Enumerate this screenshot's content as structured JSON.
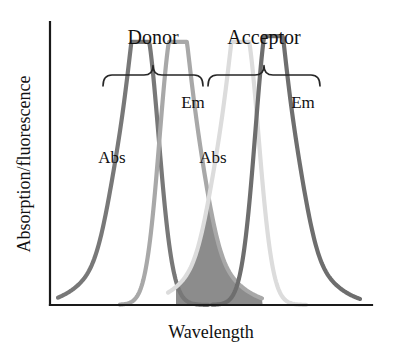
{
  "figure": {
    "kind": "fret-spectral-overlap-diagram",
    "background": "#ffffff"
  },
  "axes": {
    "y_label": "Absorption/fluorescence",
    "x_label": "Wavelength",
    "axis_color": "#1a1a1a",
    "origin_px": {
      "x": 50,
      "y": 305
    },
    "y_top_px": 22,
    "x_right_px": 372,
    "ticks": [],
    "gridlines": false
  },
  "groups": [
    {
      "id": "donor",
      "label": "Donor",
      "brace_x0": 103,
      "brace_x1": 203,
      "label_x": 153,
      "label_y": 44
    },
    {
      "id": "acceptor",
      "label": "Acceptor",
      "brace_x0": 208,
      "brace_x1": 320,
      "label_x": 264,
      "label_y": 44
    }
  ],
  "peak_labels": [
    {
      "id": "donor-em-label",
      "text": "Em",
      "x": 193,
      "y": 108
    },
    {
      "id": "donor-abs-label",
      "text": "Abs",
      "x": 112,
      "y": 163
    },
    {
      "id": "acceptor-em-label",
      "text": "Em",
      "x": 303,
      "y": 108
    },
    {
      "id": "acceptor-abs-label",
      "text": "Abs",
      "x": 213,
      "y": 163
    }
  ],
  "colors": {
    "donor_abs": "#787878",
    "donor_em": "#a8a8a8",
    "acceptor_abs": "#dcdcdc",
    "acceptor_em": "#6e6e6e",
    "overlap_fill": "#8c8c8c",
    "axis": "#1a1a1a",
    "text": "#111111"
  },
  "chart_data": {
    "type": "line",
    "title": "",
    "xlabel": "Wavelength",
    "ylabel": "Absorption/fluorescence",
    "xlim": [
      50,
      372
    ],
    "ylim": [
      0,
      1
    ],
    "grid": false,
    "legend_position": "inline-annotations",
    "series": [
      {
        "name": "Donor Abs",
        "group": "donor",
        "kind": "absorption",
        "color": "#787878",
        "stroke_width": 4.2,
        "peak_x": 145,
        "peak_y": 0.93,
        "shoulder_side": "left",
        "shoulder_x": 119,
        "shoulder_y": 0.4,
        "start_x": 58,
        "end_x": 208
      },
      {
        "name": "Donor Em",
        "group": "donor",
        "kind": "emission",
        "color": "#a8a8a8",
        "stroke_width": 4.2,
        "peak_x": 173,
        "peak_y": 0.93,
        "shoulder_side": "right",
        "shoulder_x": 198,
        "shoulder_y": 0.4,
        "start_x": 120,
        "end_x": 262
      },
      {
        "name": "Acceptor Abs",
        "group": "acceptor",
        "kind": "absorption",
        "color": "#dcdcdc",
        "stroke_width": 4.2,
        "peak_x": 245,
        "peak_y": 0.93,
        "shoulder_side": "left",
        "shoulder_x": 219,
        "shoulder_y": 0.4,
        "start_x": 168,
        "end_x": 306
      },
      {
        "name": "Acceptor Em",
        "group": "acceptor",
        "kind": "emission",
        "color": "#6e6e6e",
        "stroke_width": 4.2,
        "peak_x": 269,
        "peak_y": 0.95,
        "shoulder_side": "right",
        "shoulder_x": 295,
        "shoulder_y": 0.4,
        "start_x": 212,
        "end_x": 360
      }
    ],
    "overlap_region": {
      "name": "Spectral overlap",
      "between": [
        "Donor Em",
        "Acceptor Abs"
      ],
      "fill": "#8c8c8c",
      "x_start": 176,
      "x_end": 268,
      "apex_x": 212,
      "apex_y": 0.36
    }
  }
}
